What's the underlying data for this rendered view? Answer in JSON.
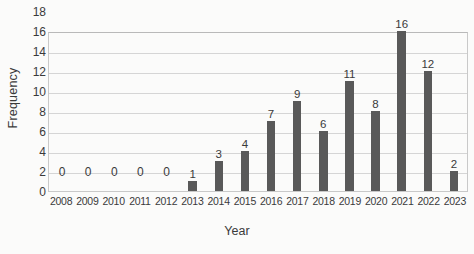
{
  "chart_data": {
    "type": "bar",
    "title": "",
    "xlabel": "Year",
    "ylabel": "Frequency",
    "categories": [
      "2008",
      "2009",
      "2010",
      "2011",
      "2012",
      "2013",
      "2014",
      "2015",
      "2016",
      "2017",
      "2018",
      "2019",
      "2020",
      "2021",
      "2022",
      "2023"
    ],
    "values": [
      0,
      0,
      0,
      0,
      0,
      1,
      3,
      4,
      7,
      9,
      6,
      11,
      8,
      16,
      12,
      2
    ],
    "data_labels": [
      "0",
      "0",
      "0",
      "0",
      "0",
      "1",
      "3",
      "4",
      "7",
      "9",
      "6",
      "11",
      "8",
      "16",
      "12",
      "2"
    ],
    "ylim": [
      0,
      18
    ],
    "yticks": [
      0,
      2,
      4,
      6,
      8,
      10,
      12,
      14,
      16,
      18
    ],
    "ytick_labels": [
      "0",
      "2",
      "4",
      "6",
      "8",
      "10",
      "12",
      "14",
      "16",
      "18"
    ],
    "grid": true,
    "legend": "none",
    "bar_color": "#595959",
    "grid_color": "#d5d5d5",
    "background": "#fbfbfa"
  }
}
